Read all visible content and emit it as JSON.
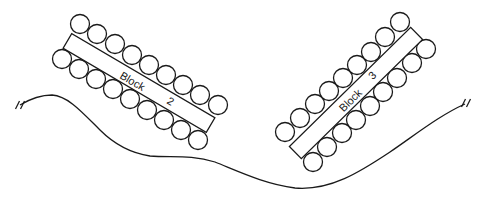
{
  "diagram": {
    "width": 485,
    "height": 199,
    "stroke_color": "#1a1a1a",
    "background": "#ffffff",
    "terrain": {
      "path": "M20,105 C30,99 40,95 52,95 C68,96 82,112 100,130 C115,145 130,153 150,156 C170,158 190,154 215,162 C240,172 265,184 295,188 C330,191 360,172 390,152 C415,135 440,115 465,104",
      "break_marks": [
        {
          "x": 20,
          "y": 105,
          "angle": -60
        },
        {
          "x": 466,
          "y": 103,
          "angle": -60
        }
      ]
    },
    "blocks": [
      {
        "id": "block-2",
        "label_word": "Block",
        "label_number": "2",
        "rect": {
          "cx": 139,
          "cy": 83,
          "length": 166,
          "width": 17,
          "angle": 30.4
        },
        "label_word_pos": {
          "x": 132,
          "y": 82
        },
        "label_number_pos": {
          "x": 170,
          "y": 102
        },
        "text_angle": 30.4,
        "circle_radius": 9.5,
        "circles_top": [
          [
            80,
            24
          ],
          [
            97,
            34
          ],
          [
            115,
            44
          ],
          [
            132,
            55
          ],
          [
            149,
            65
          ],
          [
            166,
            75
          ],
          [
            183,
            85
          ],
          [
            200,
            95
          ],
          [
            218,
            105
          ]
        ],
        "circles_bottom": [
          [
            62,
            59
          ],
          [
            79,
            69
          ],
          [
            96,
            79
          ],
          [
            113,
            89
          ],
          [
            130,
            99
          ],
          [
            147,
            110
          ],
          [
            164,
            120
          ],
          [
            181,
            130
          ],
          [
            198,
            140
          ]
        ]
      },
      {
        "id": "block-3",
        "label_word": "Block",
        "label_number": "3",
        "rect": {
          "cx": 356,
          "cy": 93,
          "length": 170,
          "width": 17,
          "angle": -44.5
        },
        "label_word_pos": {
          "x": 351,
          "y": 101
        },
        "label_number_pos": {
          "x": 373,
          "y": 76
        },
        "text_angle": -44.5,
        "circle_radius": 9.5,
        "circles_top": [
          [
            285,
            132
          ],
          [
            300,
            118
          ],
          [
            315,
            104
          ],
          [
            329,
            91
          ],
          [
            343,
            78
          ],
          [
            357,
            65
          ],
          [
            371,
            52
          ],
          [
            385,
            37
          ],
          [
            400,
            22
          ]
        ],
        "circles_bottom": [
          [
            313,
            162
          ],
          [
            327,
            147
          ],
          [
            342,
            133
          ],
          [
            356,
            120
          ],
          [
            370,
            106
          ],
          [
            383,
            92
          ],
          [
            397,
            78
          ],
          [
            412,
            63
          ],
          [
            426,
            49
          ]
        ]
      }
    ]
  }
}
